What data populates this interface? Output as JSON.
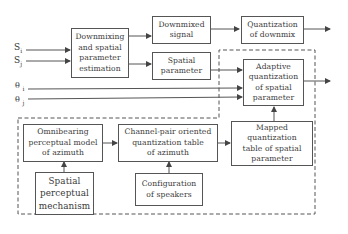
{
  "diagram": {
    "inputs": {
      "s_i": {
        "base": "S",
        "sub": "i"
      },
      "s_j": {
        "base": "S",
        "sub": "j"
      },
      "theta_i": {
        "base": "θ",
        "sub": "i"
      },
      "theta_j": {
        "base": "θ",
        "sub": "j"
      }
    },
    "blocks": {
      "downmixing": "Downmixing\nand spatial\nparameter\nestimation",
      "downmixed_signal": "Downmixed\nsignal",
      "quantization_downmix": "Quantization\nof downmix",
      "spatial_parameter": "Spatial\nparameter",
      "adaptive_quantization": "Adaptive\nquantization\nof spatial\nparameter",
      "omnibearing_model": "Omnibearing\nperceptual model\nof azimuth",
      "channel_pair_table": "Channel-pair oriented\nquantization table\nof azimuth",
      "mapped_table": "Mapped\nquantization\ntable of spatial\nparameter",
      "spatial_perceptual_mechanism": "Spatial\nperceptual\nmechanism",
      "speaker_configuration": "Configuration\nof speakers"
    },
    "colors": {
      "line": "#555555",
      "dashed_border": "#555555",
      "background": "#ffffff"
    }
  }
}
